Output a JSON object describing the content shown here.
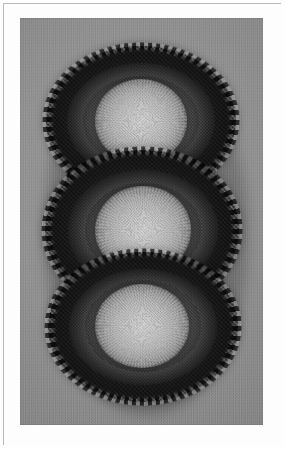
{
  "page": {
    "title": "Braided Rug",
    "background_color": "#fefefe",
    "width": 285,
    "height": 449
  },
  "frame": {
    "name": "thin-rule-frame",
    "line_color": "#b9b9b9",
    "mat_color": "#fdfdfd"
  },
  "photograph": {
    "caption": "Braided rug, three-lobed cloverleaf form, photographed on a plain gray floor",
    "medium": "black and white photograph",
    "background_color": "#8e8e8e",
    "x": 20,
    "y": 18,
    "width": 243,
    "height": 407
  },
  "rug": {
    "name": "three-lobed braided rug",
    "shape": "cloverleaf / triple-oval",
    "technique": "braided strip, sewn in concentric rounds with picot edge",
    "lobe_count": 3,
    "medallion_count": 3,
    "colors": {
      "outer_band": "#1a1a1a",
      "mid_band": "#555555",
      "inner_band": "#6a6a6a",
      "medallion": "#bdbdbd",
      "edge_picot": "#111111"
    },
    "lobes": [
      {
        "label": "top lobe",
        "medallion_label": "top medallion"
      },
      {
        "label": "middle lobe",
        "medallion_label": "center medallion"
      },
      {
        "label": "bottom lobe",
        "medallion_label": "bottom medallion"
      }
    ]
  }
}
